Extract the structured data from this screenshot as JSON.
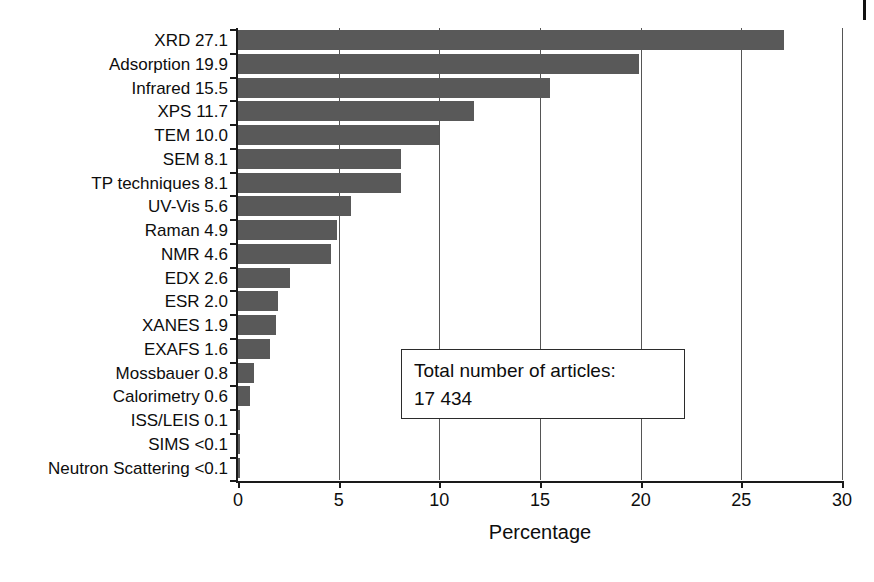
{
  "chart_data": {
    "type": "bar",
    "orientation": "horizontal",
    "title": "",
    "xlabel": "Percentage",
    "ylabel": "",
    "xlim": [
      0,
      30
    ],
    "xticks": [
      0,
      5,
      10,
      15,
      20,
      25,
      30
    ],
    "xtick_labels": [
      "0",
      "5",
      "10",
      "15",
      "20",
      "25",
      "30"
    ],
    "grid": "vertical",
    "legend": "none",
    "bar_color": "#595959",
    "categories": [
      "XRD",
      "Adsorption",
      "Infrared",
      "XPS",
      "TEM",
      "SEM",
      "TP techniques",
      "UV-Vis",
      "Raman",
      "NMR",
      "EDX",
      "ESR",
      "XANES",
      "EXAFS",
      "Mossbauer",
      "Calorimetry",
      "ISS/LEIS",
      "SIMS",
      "Neutron Scattering"
    ],
    "values": [
      27.1,
      19.9,
      15.5,
      11.7,
      10.0,
      8.1,
      8.1,
      5.6,
      4.9,
      4.6,
      2.6,
      2.0,
      1.9,
      1.6,
      0.8,
      0.6,
      0.1,
      0.05,
      0.05
    ],
    "value_labels": [
      "27.1",
      "19.9",
      "15.5",
      "11.7",
      "10.0",
      "8.1",
      "8.1",
      "5.6",
      "4.9",
      "4.6",
      "2.6",
      "2.0",
      "1.9",
      "1.6",
      "0.8",
      "0.6",
      "0.1",
      "<0.1",
      "<0.1"
    ],
    "tick_labels": [
      "XRD 27.1",
      "Adsorption 19.9",
      "Infrared 15.5",
      "XPS 11.7",
      "TEM 10.0",
      "SEM 8.1",
      "TP techniques 8.1",
      "UV-Vis 5.6",
      "Raman 4.9",
      "NMR 4.6",
      "EDX 2.6",
      "ESR 2.0",
      "XANES 1.9",
      "EXAFS 1.6",
      "Mossbauer 0.8",
      "Calorimetry 0.6",
      "ISS/LEIS 0.1",
      "SIMS <0.1",
      "Neutron Scattering <0.1"
    ],
    "annotations": [
      {
        "name": "total-articles-box",
        "lines": [
          "Total number of articles:",
          "17 434"
        ]
      }
    ]
  },
  "annotation": {
    "line1": "Total number of articles:",
    "line2": "17 434"
  },
  "axis": {
    "x_title": "Percentage"
  }
}
